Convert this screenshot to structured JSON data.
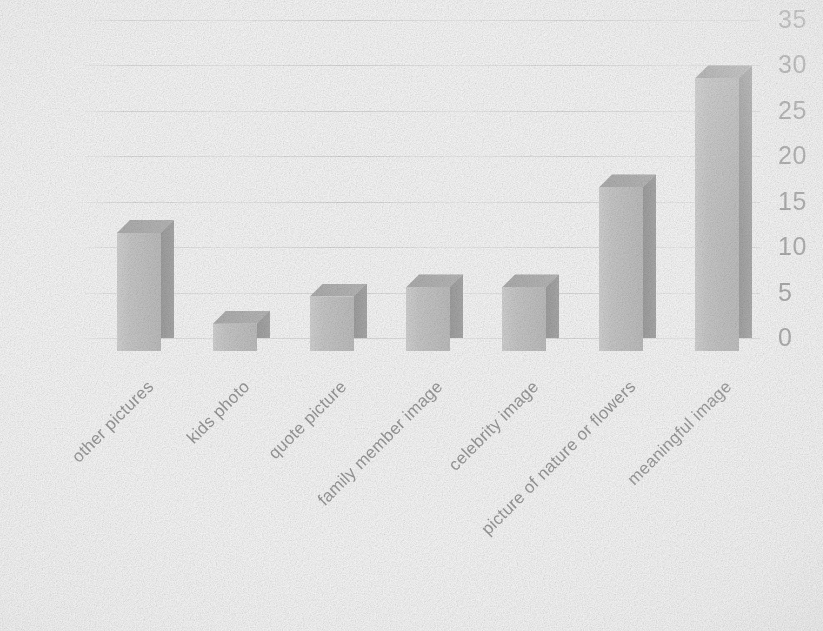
{
  "chart_data": {
    "type": "bar",
    "title": "",
    "subtitle": "",
    "xlabel": "",
    "ylabel": "",
    "categories": [
      "other pictures",
      "kids photo",
      "quote picture",
      "family member image",
      "celebrity image",
      "picture of nature or flowers",
      "meaningful image"
    ],
    "values": [
      13,
      3,
      6,
      7,
      7,
      18,
      30
    ],
    "ylim": [
      0,
      35
    ],
    "ytick_labels": [
      "35",
      "30",
      "25",
      "20",
      "15",
      "10",
      "5",
      "0"
    ],
    "ytick_values": [
      35,
      30,
      25,
      20,
      15,
      10,
      5,
      0
    ],
    "ytick_interval": 5,
    "grid": true,
    "grid_axis": "y",
    "legend": false,
    "legend_position": "none",
    "style_3d": true,
    "axis_position": "right",
    "xtick_rotation": -45,
    "colors": {
      "bar_front": "#c9c9c9",
      "bar_side": "#adadad",
      "bar_top": "#bcbcbc",
      "gridline": "#e0e0e0",
      "tick_label": "#a6a6a6",
      "category_label": "#9e9e9e",
      "background": "#ffffff"
    }
  }
}
